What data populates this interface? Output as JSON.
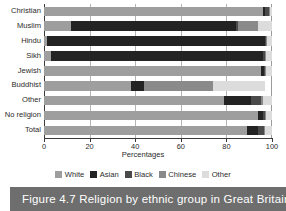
{
  "caption": {
    "text": "Figure 4.7 Religion by ethnic group in Great Britain,"
  },
  "colors": {
    "white": "#9e9e9e",
    "asian": "#232323",
    "black": "#4a4a4a",
    "chinese": "#8a8a8a",
    "other": "#dcdcdc",
    "axis": "#3a3a3a",
    "gridline": "#b5b5b5",
    "banner": "#6e6e6e"
  },
  "axis": {
    "x_title": "Percentages",
    "x_ticks": [
      "0",
      "20",
      "40",
      "60",
      "80",
      "100"
    ]
  },
  "legend": {
    "items": [
      {
        "label": "White",
        "color": "#9e9e9e"
      },
      {
        "label": "Asian",
        "color": "#232323"
      },
      {
        "label": "Black",
        "color": "#4a4a4a"
      },
      {
        "label": "Chinese",
        "color": "#8a8a8a"
      },
      {
        "label": "Other",
        "color": "#dcdcdc"
      }
    ]
  },
  "chart_data": {
    "type": "bar",
    "orientation": "horizontal",
    "stacked": true,
    "title": "Figure 4.7 Religion by ethnic group in Great Britain,",
    "xlabel": "Percentages",
    "ylabel": "",
    "xlim": [
      0,
      100
    ],
    "xticks": [
      0,
      20,
      40,
      60,
      80,
      100
    ],
    "grid": "vertical",
    "legend_position": "bottom",
    "categories": [
      "Christian",
      "Muslim",
      "Hindu",
      "Sikh",
      "Jewish",
      "Buddhist",
      "Other",
      "No religion",
      "Total"
    ],
    "series": [
      {
        "name": "White",
        "color": "#9e9e9e",
        "values": [
          96.0,
          12.0,
          1.5,
          3.0,
          95.0,
          38.0,
          79.0,
          94.0,
          89.0
        ]
      },
      {
        "name": "Asian",
        "color": "#232323",
        "values": [
          1.0,
          72.0,
          95.5,
          93.0,
          1.5,
          6.0,
          12.0,
          2.0,
          5.0
        ]
      },
      {
        "name": "Black",
        "color": "#4a4a4a",
        "values": [
          1.5,
          1.0,
          0.5,
          1.0,
          0.5,
          0.0,
          4.0,
          1.0,
          2.5
        ]
      },
      {
        "name": "Chinese",
        "color": "#8a8a8a",
        "values": [
          0.5,
          9.0,
          0.5,
          0.5,
          0.5,
          30.0,
          1.0,
          0.5,
          0.5
        ]
      },
      {
        "name": "Other",
        "color": "#dcdcdc",
        "values": [
          1.0,
          6.0,
          2.0,
          2.5,
          2.5,
          23.0,
          4.0,
          2.5,
          3.0
        ]
      }
    ]
  }
}
